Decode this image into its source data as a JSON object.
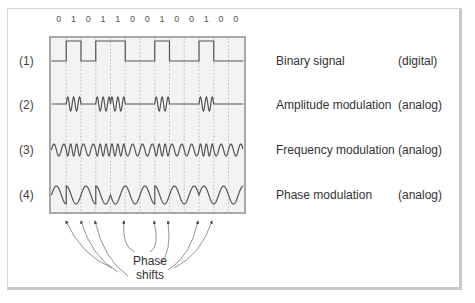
{
  "bits": [
    "0",
    "1",
    "0",
    "1",
    "1",
    "0",
    "0",
    "1",
    "0",
    "0",
    "1",
    "0",
    "0"
  ],
  "rows": [
    {
      "index": "(1)",
      "name": "Binary signal",
      "type": "(digital)"
    },
    {
      "index": "(2)",
      "name": "Amplitude modulation",
      "type": "(analog)"
    },
    {
      "index": "(3)",
      "name": "Frequency modulation",
      "type": "(analog)"
    },
    {
      "index": "(4)",
      "name": "Phase modulation",
      "type": "(analog)"
    }
  ],
  "annotation": {
    "line1": "Phase",
    "line2": "shifts"
  },
  "colors": {
    "signal": "#555555",
    "chart_bg": "#f3f3f3",
    "chart_border": "#aaaaaa",
    "grid": "#999999"
  },
  "chart_data": {
    "type": "diagram",
    "title": "",
    "bit_sequence": [
      0,
      1,
      0,
      1,
      1,
      0,
      0,
      1,
      0,
      0,
      1,
      0,
      0
    ],
    "signals": [
      "Binary signal (digital)",
      "Amplitude modulation (analog)",
      "Frequency modulation (analog)",
      "Phase modulation (analog)"
    ],
    "annotations": [
      "Phase shifts"
    ]
  }
}
